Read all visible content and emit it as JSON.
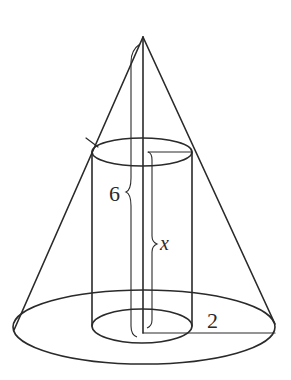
{
  "figure": {
    "labels": {
      "cone_height": "6",
      "cylinder_height": "x",
      "base_radius": "2"
    },
    "stroke_color": "#2a2a2a",
    "background": "#ffffff"
  }
}
